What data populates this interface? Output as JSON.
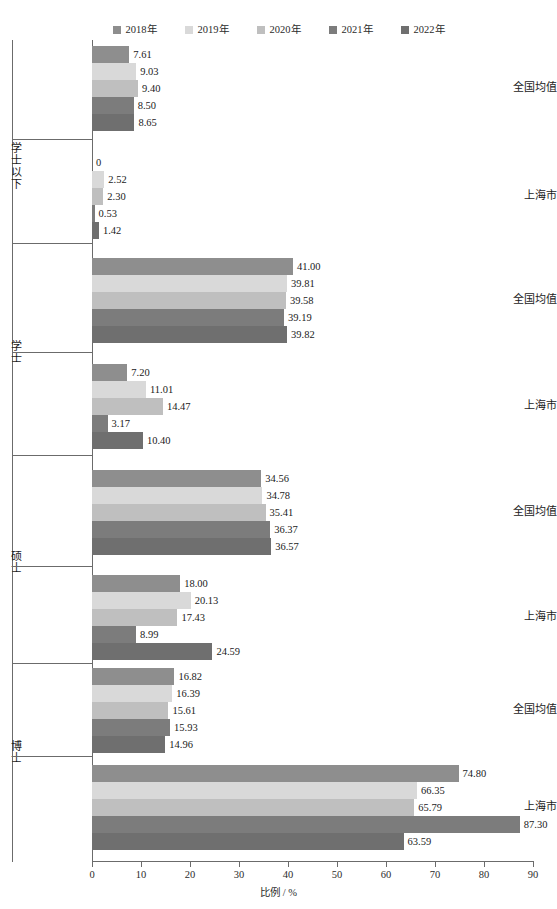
{
  "chart_data": {
    "type": "bar",
    "orientation": "horizontal",
    "title": "",
    "xlabel": "比例 / %",
    "ylabel": "",
    "xlim": [
      0,
      90
    ],
    "xticks": [
      0,
      10,
      20,
      30,
      40,
      50,
      60,
      70,
      80,
      90
    ],
    "grid": false,
    "legend_position": "top-center",
    "series": [
      {
        "name": "2018年",
        "color": "#8e8e8e"
      },
      {
        "name": "2019年",
        "color": "#d9d9d9"
      },
      {
        "name": "2020年",
        "color": "#bfbfbf"
      },
      {
        "name": "2021年",
        "color": "#7c7c7c"
      },
      {
        "name": "2022年",
        "color": "#6f6f6f"
      }
    ],
    "groups": [
      {
        "level": "学士以下",
        "categories": [
          {
            "label": "全国均值",
            "values": [
              7.61,
              9.03,
              9.4,
              8.5,
              8.65
            ]
          },
          {
            "label": "上海市",
            "values": [
              0,
              2.52,
              2.3,
              0.53,
              1.42
            ]
          }
        ]
      },
      {
        "level": "学士",
        "categories": [
          {
            "label": "全国均值",
            "values": [
              41.0,
              39.81,
              39.58,
              39.19,
              39.82
            ]
          },
          {
            "label": "上海市",
            "values": [
              7.2,
              11.01,
              14.47,
              3.17,
              10.4
            ]
          }
        ]
      },
      {
        "level": "硕士",
        "categories": [
          {
            "label": "全国均值",
            "values": [
              34.56,
              34.78,
              35.41,
              36.37,
              36.57
            ]
          },
          {
            "label": "上海市",
            "values": [
              18.0,
              20.13,
              17.43,
              8.99,
              24.59
            ]
          }
        ]
      },
      {
        "level": "博士",
        "categories": [
          {
            "label": "全国均值",
            "values": [
              16.82,
              16.39,
              15.61,
              15.93,
              14.96
            ]
          },
          {
            "label": "上海市",
            "values": [
              74.8,
              66.35,
              65.79,
              87.3,
              63.59
            ]
          }
        ]
      }
    ],
    "value_labels": {
      "g0c0": [
        "7.61",
        "9.03",
        "9.40",
        "8.50",
        "8.65"
      ],
      "g0c1": [
        "0",
        "2.52",
        "2.30",
        "0.53",
        "1.42"
      ],
      "g1c0": [
        "41.00",
        "39.81",
        "39.58",
        "39.19",
        "39.82"
      ],
      "g1c1": [
        "7.20",
        "11.01",
        "14.47",
        "3.17",
        "10.40"
      ],
      "g2c0": [
        "34.56",
        "34.78",
        "35.41",
        "36.37",
        "36.57"
      ],
      "g2c1": [
        "18.00",
        "20.13",
        "17.43",
        "8.99",
        "24.59"
      ],
      "g3c0": [
        "16.82",
        "16.39",
        "15.61",
        "15.93",
        "14.96"
      ],
      "g3c1": [
        "74.80",
        "66.35",
        "65.79",
        "87.30",
        "63.59"
      ]
    }
  },
  "axis": {
    "x_title": "比例 / %",
    "ticks": [
      "0",
      "10",
      "20",
      "30",
      "40",
      "50",
      "60",
      "70",
      "80",
      "90"
    ]
  },
  "legend": {
    "items": [
      {
        "label": "2018年",
        "color": "#8e8e8e"
      },
      {
        "label": "2019年",
        "color": "#d9d9d9"
      },
      {
        "label": "2020年",
        "color": "#bfbfbf"
      },
      {
        "label": "2021年",
        "color": "#7c7c7c"
      },
      {
        "label": "2022年",
        "color": "#6f6f6f"
      }
    ]
  },
  "levels": {
    "l0": "学士以下",
    "l1": "学士",
    "l2": "硕士",
    "l3": "博士"
  },
  "cats": {
    "national": "全国均值",
    "shanghai": "上海市"
  }
}
